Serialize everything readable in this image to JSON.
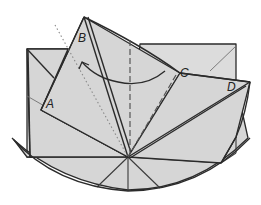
{
  "diagram": {
    "type": "origami-fold-step",
    "labels": {
      "a": "A",
      "b": "B",
      "c": "C",
      "d": "D"
    },
    "colors": {
      "paper": "#d6d6d6",
      "line": "#2b2b2b",
      "background": "#ffffff"
    },
    "annotations": {
      "arrow": "curved-arrow-from-C-to-B",
      "valley_fold": "dashed-vertical-line",
      "mountain_fold": "dotted-line"
    }
  }
}
